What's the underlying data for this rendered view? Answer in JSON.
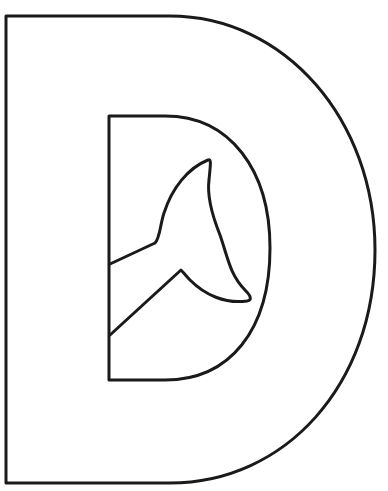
{
  "image": {
    "subject": "letter-D-coloring-page",
    "letter": "D",
    "inner_motif": "whale-tail",
    "stroke_color": "#1a1a1a",
    "fill_color": "#ffffff"
  }
}
